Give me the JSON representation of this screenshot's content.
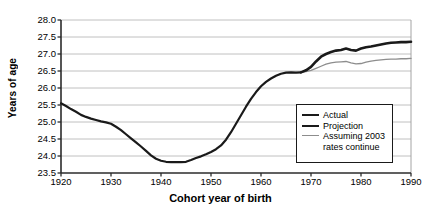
{
  "chart_data": {
    "type": "line",
    "title": "",
    "xlabel": "Cohort year of birth",
    "ylabel": "Years of age",
    "xlim": [
      1920,
      1990
    ],
    "ylim": [
      23.5,
      28.0
    ],
    "xticks": [
      "1920",
      "1930",
      "1940",
      "1950",
      "1960",
      "1970",
      "1980",
      "1990"
    ],
    "yticks": [
      "28.0",
      "27.5",
      "27.0",
      "26.5",
      "26.0",
      "25.5",
      "25.0",
      "24.5",
      "24.0",
      "23.5"
    ],
    "grid": "horizontal",
    "legend_position": "inside-right-lower",
    "colors": {
      "actual": "#1a1a1a",
      "projection": "#1a1a1a",
      "assuming": "#8d8d8d"
    },
    "series": [
      {
        "name": "Actual",
        "x": [
          1920,
          1921,
          1922,
          1923,
          1924,
          1925,
          1926,
          1927,
          1928,
          1929,
          1930,
          1931,
          1932,
          1933,
          1934,
          1935,
          1936,
          1937,
          1938,
          1939,
          1940,
          1941,
          1942,
          1943,
          1944,
          1945,
          1946,
          1947,
          1948,
          1949,
          1950,
          1951,
          1952,
          1953,
          1954,
          1955,
          1956,
          1957,
          1958,
          1959,
          1960,
          1961,
          1962,
          1963,
          1964,
          1965,
          1966,
          1967,
          1968
        ],
        "values": [
          25.55,
          25.47,
          25.38,
          25.3,
          25.21,
          25.15,
          25.1,
          25.06,
          25.02,
          24.99,
          24.95,
          24.86,
          24.76,
          24.64,
          24.52,
          24.4,
          24.28,
          24.15,
          24.02,
          23.92,
          23.86,
          23.83,
          23.82,
          23.82,
          23.82,
          23.83,
          23.88,
          23.94,
          23.99,
          24.05,
          24.12,
          24.2,
          24.31,
          24.48,
          24.7,
          24.95,
          25.2,
          25.45,
          25.68,
          25.88,
          26.05,
          26.18,
          26.28,
          26.36,
          26.42,
          26.45,
          26.46,
          26.45,
          26.46
        ]
      },
      {
        "name": "Projection",
        "x": [
          1968,
          1969,
          1970,
          1971,
          1972,
          1973,
          1974,
          1975,
          1976,
          1977,
          1978,
          1979,
          1980,
          1981,
          1982,
          1983,
          1984,
          1985,
          1986,
          1987,
          1988,
          1989,
          1990
        ],
        "values": [
          26.46,
          26.52,
          26.62,
          26.78,
          26.92,
          27.0,
          27.06,
          27.1,
          27.12,
          27.16,
          27.12,
          27.1,
          27.16,
          27.2,
          27.22,
          27.25,
          27.28,
          27.31,
          27.33,
          27.34,
          27.35,
          27.35,
          27.36
        ]
      },
      {
        "name": "Assuming 2003\nrates continue",
        "x": [
          1968,
          1969,
          1970,
          1971,
          1972,
          1973,
          1974,
          1975,
          1976,
          1977,
          1978,
          1979,
          1980,
          1981,
          1982,
          1983,
          1984,
          1985,
          1986,
          1987,
          1988,
          1989,
          1990
        ],
        "values": [
          26.46,
          26.48,
          26.52,
          26.58,
          26.64,
          26.7,
          26.74,
          26.76,
          26.77,
          26.78,
          26.74,
          26.71,
          26.72,
          26.76,
          26.79,
          26.81,
          26.83,
          26.84,
          26.85,
          26.85,
          26.86,
          26.86,
          26.87
        ]
      }
    ]
  },
  "legend": {
    "items": [
      {
        "label": "Actual"
      },
      {
        "label": "Projection"
      },
      {
        "label": "Assuming 2003\nrates continue"
      }
    ]
  }
}
